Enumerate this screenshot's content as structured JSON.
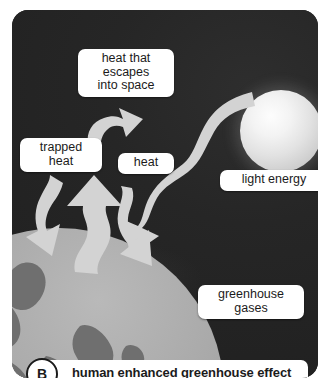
{
  "figure": {
    "panel_label": "B",
    "caption": "human enhanced greenhouse effect",
    "background_color": "#242424",
    "arrow_color": "#d2d2d2",
    "label_bg_color": "#ffffff",
    "label_text_color": "#1b1b1b"
  },
  "labels": {
    "escape": "heat that\nescapes\ninto space",
    "trapped": "trapped\nheat",
    "heat": "heat",
    "light": "light energy",
    "greenhouse": "greenhouse\ngases"
  },
  "objects": {
    "sun": "sun",
    "earth": "earth",
    "atmosphere": "atmosphere-glow"
  },
  "arrows": {
    "escaping_heat": "heat-escaping-to-space-arrow",
    "trapped_heat": "trapped-heat-down-arrow",
    "rising_heat": "rising-heat-up-arrow",
    "reflected_heat": "reflected-heat-down-arrow",
    "light_energy": "light-energy-wave-arrow"
  }
}
